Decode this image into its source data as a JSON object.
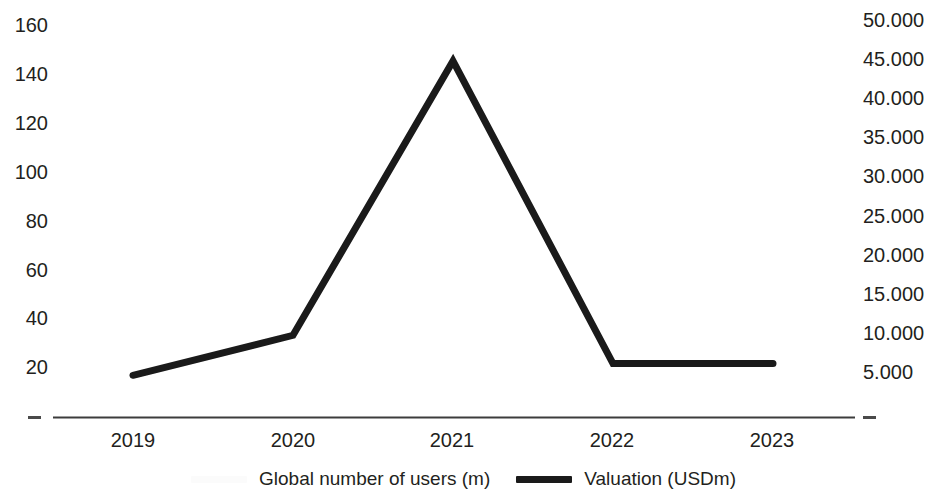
{
  "chart_data": {
    "type": "line",
    "title": "",
    "xlabel": "",
    "ylabel": "",
    "grid": false,
    "legend_position": "bottom-center",
    "categories": [
      "2019",
      "2020",
      "2021",
      "2022",
      "2023"
    ],
    "axes": {
      "x": {
        "tick_labels": [
          "2019",
          "2020",
          "2021",
          "2022",
          "2023"
        ]
      },
      "y_left": {
        "label": "Global number of users (m)",
        "tick_labels": [
          "160",
          "140",
          "120",
          "100",
          "80",
          "60",
          "40",
          "20",
          "–"
        ],
        "tick_values": [
          160,
          140,
          120,
          100,
          80,
          60,
          40,
          20,
          0
        ],
        "ylim": [
          0,
          160
        ]
      },
      "y_right": {
        "label": "Valuation (USDm)",
        "tick_labels": [
          "50.000",
          "45.000",
          "40.000",
          "35.000",
          "30.000",
          "25.000",
          "20.000",
          "15.000",
          "10.000",
          "5.000",
          "–"
        ],
        "tick_values": [
          50000,
          45000,
          40000,
          35000,
          30000,
          25000,
          20000,
          15000,
          10000,
          5000,
          0
        ],
        "ylim": [
          0,
          50000
        ]
      }
    },
    "series": [
      {
        "name": "Global number of users (m)",
        "axis": "y_left",
        "color": "#fbfbfb",
        "visible": false,
        "values": [
          17,
          34,
          148,
          22,
          22
        ]
      },
      {
        "name": "Valuation (USDm)",
        "axis": "y_right",
        "color": "#1a1a1a",
        "visible": true,
        "values": [
          5300,
          10400,
          45300,
          6800,
          6800
        ]
      }
    ]
  },
  "legend": {
    "entries": [
      {
        "label": "Global number of users (m)",
        "swatch": "hidden-series"
      },
      {
        "label": "Valuation (USDm)",
        "swatch": "valuation-series"
      }
    ]
  },
  "axis_left": {
    "t0": "160",
    "t1": "140",
    "t2": "120",
    "t3": "100",
    "t4": "80",
    "t5": "60",
    "t6": "40",
    "t7": "20",
    "t8": "–"
  },
  "axis_right": {
    "t0": "50.000",
    "t1": "45.000",
    "t2": "40.000",
    "t3": "35.000",
    "t4": "30.000",
    "t5": "25.000",
    "t6": "20.000",
    "t7": "15.000",
    "t8": "10.000",
    "t9": "5.000",
    "t10": "–"
  },
  "axis_x": {
    "t0": "2019",
    "t1": "2020",
    "t2": "2021",
    "t3": "2022",
    "t4": "2023"
  }
}
